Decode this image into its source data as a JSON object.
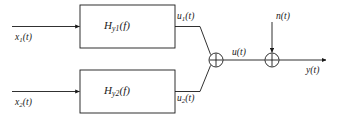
{
  "diagram": {
    "type": "block-diagram",
    "colors": {
      "line": "#1a1a1a",
      "background": "#ffffff",
      "text": "#1a1a1a"
    },
    "blocks": [
      {
        "id": "filter-1",
        "label_base": "H",
        "label_sub": "y1",
        "label_arg": "(f)",
        "label_text": "Hy1(f)",
        "x": 80,
        "y": 5,
        "width": 95,
        "height": 43
      },
      {
        "id": "filter-2",
        "label_base": "H",
        "label_sub": "y2",
        "label_arg": "(f)",
        "label_text": "Hy2(f)",
        "x": 80,
        "y": 70,
        "width": 95,
        "height": 43
      }
    ],
    "inputs": [
      {
        "id": "input-1",
        "base": "x",
        "sub": "1",
        "arg": "(t)",
        "text": "x1(t)"
      },
      {
        "id": "input-2",
        "base": "x",
        "sub": "2",
        "arg": "(t)",
        "text": "x2(t)"
      }
    ],
    "intermediate": [
      {
        "id": "signal-u1",
        "base": "u",
        "sub": "1",
        "arg": "(t)",
        "text": "u1(t)"
      },
      {
        "id": "signal-u2",
        "base": "u",
        "sub": "2",
        "arg": "(t)",
        "text": "u2(t)"
      }
    ],
    "sum_signal": {
      "id": "signal-u",
      "base": "u",
      "sub": "",
      "arg": "(t)",
      "text": "u(t)"
    },
    "noise_signal": {
      "id": "signal-n",
      "base": "n",
      "sub": "",
      "arg": "(t)",
      "text": "n(t)"
    },
    "output_signal": {
      "id": "signal-y",
      "base": "y",
      "sub": "",
      "arg": "(t)",
      "text": "y(t)"
    },
    "junctions": [
      {
        "id": "adder-1",
        "cx": 216,
        "cy": 60,
        "r": 7,
        "glyph": "plus-circle"
      },
      {
        "id": "adder-2",
        "cx": 272,
        "cy": 60,
        "r": 7,
        "glyph": "plus-circle"
      }
    ]
  }
}
